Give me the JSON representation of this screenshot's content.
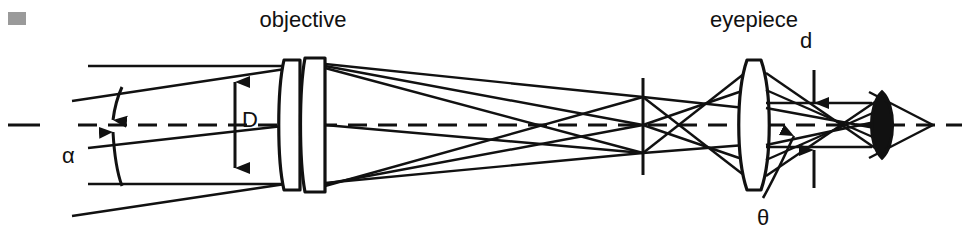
{
  "figure": {
    "title_objective": "objective",
    "title_eyepiece": "eyepiece",
    "symbol_D": "D",
    "symbol_alpha": "α",
    "symbol_d": "d",
    "symbol_theta": "θ",
    "width": 967,
    "height": 237,
    "background_color": "#ffffff",
    "ink_color": "#111111",
    "gray_marker_color": "#9a9a9a"
  },
  "diagram": {
    "type": "optical-ray-diagram",
    "optical_axis_y": 125,
    "components": [
      {
        "name": "objective-lens-doublet",
        "x": 290,
        "elements": 2,
        "aperture_label": "D"
      },
      {
        "name": "intermediate-image-plane",
        "x": 643
      },
      {
        "name": "eyepiece-lens",
        "x": 753,
        "aperture_label": ""
      },
      {
        "name": "exit-pupil",
        "x": 845,
        "label": "d"
      },
      {
        "name": "eye",
        "x": 885
      }
    ],
    "annotations": [
      {
        "name": "D",
        "meaning": "objective aperture diameter",
        "orientation": "vertical-double-arrow",
        "x": 235,
        "y_top": 68,
        "y_bottom": 182
      },
      {
        "name": "alpha",
        "meaning": "half field angle at objective",
        "orientation": "arc-double-arrow",
        "x": 140,
        "y_top": 88,
        "y_bottom": 162
      },
      {
        "name": "d",
        "meaning": "exit pupil diameter",
        "orientation": "vertical-inward-arrows",
        "x": 815,
        "y_top": 62,
        "y_bottom": 192
      },
      {
        "name": "theta",
        "meaning": "apparent field angle at eye",
        "orientation": "leader-line-arrow",
        "x": 768,
        "y": 215
      }
    ]
  }
}
